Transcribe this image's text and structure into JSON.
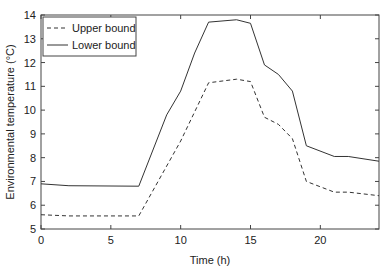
{
  "chart_data": {
    "type": "line",
    "title": "",
    "xlabel": "Time (h)",
    "ylabel": "Environmental temperature (°C)",
    "xlim": [
      0,
      24.2
    ],
    "ylim": [
      5,
      14
    ],
    "xticks": [
      0,
      5,
      10,
      15,
      20
    ],
    "yticks": [
      5,
      6,
      7,
      8,
      9,
      10,
      11,
      12,
      13,
      14
    ],
    "legend_position": "upper left",
    "grid": false,
    "series": [
      {
        "name": "Upper bound",
        "style": "dashed",
        "x": [
          0,
          2,
          7,
          10,
          12,
          14,
          15,
          16,
          17,
          18,
          19,
          21,
          22,
          24.2
        ],
        "y": [
          5.6,
          5.55,
          5.55,
          8.7,
          11.15,
          11.3,
          11.2,
          9.7,
          9.4,
          8.8,
          7.0,
          6.55,
          6.55,
          6.4
        ]
      },
      {
        "name": "Lower bound",
        "style": "solid",
        "x": [
          0,
          2,
          7,
          9,
          10,
          11,
          12,
          14,
          15,
          16,
          17,
          18,
          19,
          21,
          22,
          24.2
        ],
        "y": [
          6.9,
          6.82,
          6.8,
          9.8,
          10.8,
          12.4,
          13.7,
          13.8,
          13.65,
          11.9,
          11.5,
          10.8,
          8.5,
          8.05,
          8.05,
          7.85
        ]
      }
    ]
  }
}
